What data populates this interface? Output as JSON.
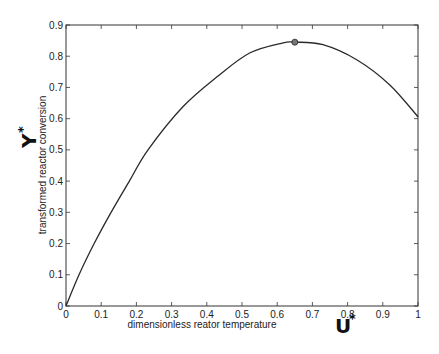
{
  "chart_data": {
    "type": "line",
    "title": "",
    "xlabel": "dimensionless reator temperature",
    "ylabel": "transformed reactor conversion",
    "xlabel_symbol": "U",
    "ylabel_symbol": "Y",
    "symbol_superscript": "*",
    "xlim": [
      0,
      1
    ],
    "ylim": [
      0,
      0.9
    ],
    "xticks": [
      "0",
      "0.1",
      "0.2",
      "0.3",
      "0.4",
      "0.5",
      "0.6",
      "0.7",
      "0.8",
      "0.9",
      "1"
    ],
    "yticks": [
      "0",
      "0.1",
      "0.2",
      "0.3",
      "0.4",
      "0.5",
      "0.6",
      "0.7",
      "0.8",
      "0.9"
    ],
    "grid": false,
    "legend": null,
    "series": [
      {
        "name": "Y* vs U*",
        "x": [
          0,
          0.037,
          0.08,
          0.128,
          0.18,
          0.233,
          0.332,
          0.429,
          0.523,
          0.617,
          0.65,
          0.73,
          0.827,
          0.92,
          1.0
        ],
        "y": [
          0,
          0.1,
          0.2,
          0.3,
          0.4,
          0.5,
          0.638,
          0.734,
          0.811,
          0.843,
          0.845,
          0.837,
          0.788,
          0.708,
          0.606
        ]
      }
    ],
    "annotations": [
      {
        "type": "marker",
        "label": "maximum",
        "x": 0.65,
        "y": 0.845
      }
    ]
  },
  "style": {
    "line_color": "#2a2a2a",
    "axis_color": "#333333",
    "marker_fill": "#777777"
  }
}
